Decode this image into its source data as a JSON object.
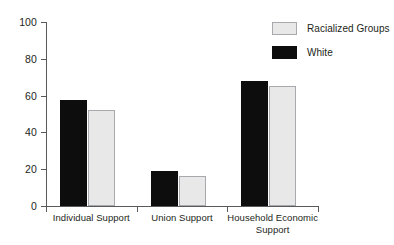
{
  "chart_data": {
    "type": "bar",
    "title": "",
    "subtitle": "",
    "xlabel": "",
    "ylabel": "",
    "ylim": [
      0,
      100
    ],
    "grid": false,
    "legend_position": "top-right",
    "categories": [
      "Individual Support",
      "Union Support",
      "Household Economic Support"
    ],
    "category_lines": [
      [
        "Individual Support"
      ],
      [
        "Union Support"
      ],
      [
        "Household Economic",
        "Support"
      ]
    ],
    "series": [
      {
        "name": "White",
        "color": "#0d0d0d",
        "values": [
          57.5,
          19,
          68
        ]
      },
      {
        "name": "Racialized Groups",
        "color": "#e8e8e8",
        "values": [
          52,
          16.5,
          65
        ]
      }
    ],
    "yticks": [
      0,
      20,
      40,
      60,
      80,
      100
    ],
    "ytick_labels": [
      "0",
      "20",
      "40",
      "60",
      "80",
      "100"
    ]
  },
  "legend": {
    "entries": [
      {
        "label": "Racialized Groups",
        "series": "racialized-series"
      },
      {
        "label": "White",
        "series": "white-series"
      }
    ]
  },
  "colors": {
    "white_series": "#0d0d0d",
    "racialized_series": "#e8e8e8",
    "racialized_border": "#a7a9ac",
    "axis": "#58595b",
    "text": "#231f20",
    "background": "#ffffff"
  }
}
